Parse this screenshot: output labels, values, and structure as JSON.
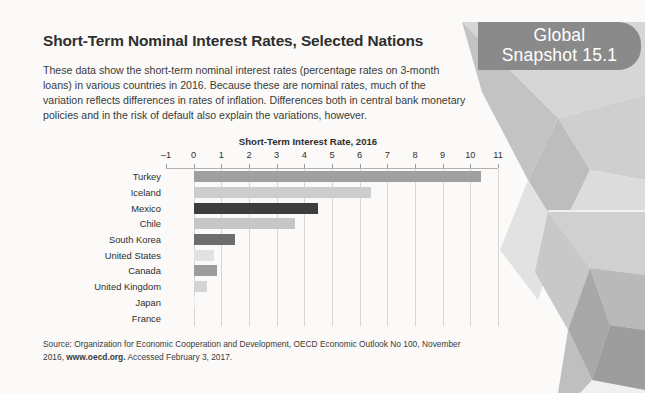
{
  "banner": {
    "line1": "Global",
    "line2": "Snapshot 15.1",
    "color": "#8a8a8a"
  },
  "header": {
    "title": "Short-Term Nominal Interest Rates, Selected Nations",
    "intro": "These data show the short-term nominal interest rates (percentage rates on 3-month loans) in various countries in 2016. Because these are nominal rates, much of the variation reflects differences in rates of inflation. Differences both in central bank monetary policies and in the risk of default also explain the variations, however."
  },
  "source": {
    "part1": "Source: Organization for Economic Cooperation and Development, OECD Economic Outlook No 100, November 2016, ",
    "link": "www.oecd.org.",
    "part2": " Accessed February 3, 2017."
  },
  "chart_data": {
    "type": "bar",
    "orientation": "horizontal",
    "title": "Short-Term Interest Rate, 2016",
    "xlabel": "",
    "ylabel": "",
    "xlim": [
      -1,
      11
    ],
    "xticks": [
      -1,
      0,
      1,
      2,
      3,
      4,
      5,
      6,
      7,
      8,
      9,
      10,
      11
    ],
    "xtick_labels": [
      "–1",
      "0",
      "1",
      "2",
      "3",
      "4",
      "5",
      "6",
      "7",
      "8",
      "9",
      "10",
      "11"
    ],
    "grid": true,
    "legend": false,
    "categories": [
      "Turkey",
      "Iceland",
      "Mexico",
      "Chile",
      "South Korea",
      "United States",
      "Canada",
      "United Kingdom",
      "Japan",
      "France"
    ],
    "values": [
      10.4,
      6.4,
      4.5,
      3.65,
      1.5,
      0.75,
      0.85,
      0.5,
      0.05,
      0.0
    ],
    "bar_colors": [
      "#a0a0a0",
      "#cdcdcd",
      "#3d3d3d",
      "#c6c6c6",
      "#6e6e6e",
      "#e2e2e2",
      "#9c9c9c",
      "#d4d4d4",
      "#ededed",
      "#f2f2f2"
    ]
  }
}
